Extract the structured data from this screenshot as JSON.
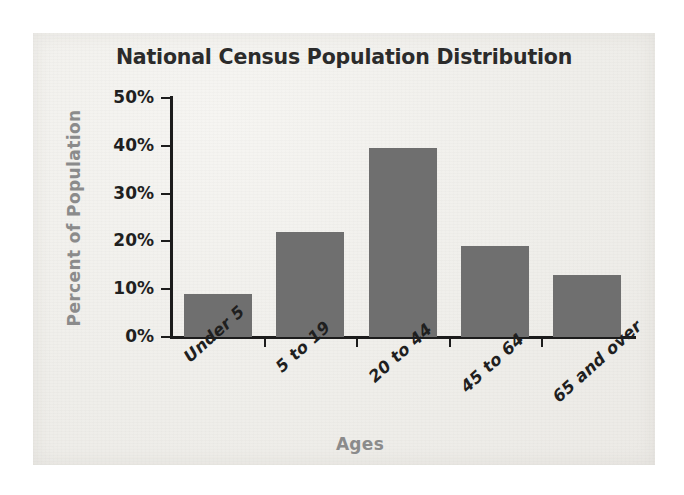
{
  "chart_data": {
    "type": "bar",
    "title": "National Census Population Distribution",
    "xlabel": "Ages",
    "ylabel": "Percent of Population",
    "categories": [
      "Under 5",
      "5 to 19",
      "20 to 44",
      "45 to 64",
      "65 and over"
    ],
    "values": [
      9,
      22,
      39.5,
      19,
      13
    ],
    "ytick_labels": [
      "0%",
      "10%",
      "20%",
      "30%",
      "40%",
      "50%"
    ],
    "ytick_values": [
      0,
      10,
      20,
      30,
      40,
      50
    ],
    "ylim": [
      0,
      50
    ],
    "grid": false,
    "legend": "none",
    "bar_color": "#6f6f6f",
    "title_color": "#2b2b2b",
    "axis_label_color": "#8b8b8b",
    "tick_label_color": "#1f1f1f",
    "axis_line_color": "#1c1c1c",
    "background_color": "#efeeea",
    "page_color": "#ffffff"
  }
}
